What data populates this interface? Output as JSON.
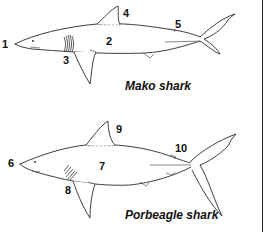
{
  "figure": {
    "panels": [
      {
        "caption": "Mako shark",
        "labels": [
          "1",
          "2",
          "3",
          "4",
          "5"
        ]
      },
      {
        "caption": "Porbeagle shark",
        "labels": [
          "6",
          "7",
          "8",
          "9",
          "10"
        ]
      }
    ],
    "colors": {
      "line": "#2a2a2a",
      "background": "#ffffff"
    }
  }
}
